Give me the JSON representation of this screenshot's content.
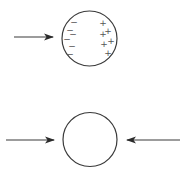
{
  "diagram": {
    "panels": [
      {
        "name": "polarized-sphere",
        "arrows": [
          {
            "direction": "right",
            "x1": 14,
            "y1": 37,
            "x2": 53,
            "y2": 37
          }
        ],
        "sphere": {
          "cx": 89.5,
          "cy": 38.5,
          "r": 27.5
        },
        "charges": {
          "negative": [
            {
              "symbol": "−",
              "x": 74,
              "y": 22
            },
            {
              "symbol": "−",
              "x": 70,
              "y": 30
            },
            {
              "symbol": "−",
              "x": 73,
              "y": 34
            },
            {
              "symbol": "−",
              "x": 67,
              "y": 39
            },
            {
              "symbol": "−",
              "x": 72,
              "y": 46
            },
            {
              "symbol": "−",
              "x": 70,
              "y": 54
            }
          ],
          "positive": [
            {
              "symbol": "+",
              "x": 103,
              "y": 23
            },
            {
              "symbol": "+",
              "x": 108,
              "y": 31
            },
            {
              "symbol": "+",
              "x": 103,
              "y": 34
            },
            {
              "symbol": "+",
              "x": 111,
              "y": 41
            },
            {
              "symbol": "+",
              "x": 104,
              "y": 44
            },
            {
              "symbol": "+",
              "x": 108,
              "y": 53
            }
          ]
        }
      },
      {
        "name": "neutral-sphere",
        "arrows": [
          {
            "direction": "right",
            "x1": 6,
            "y1": 140,
            "x2": 54,
            "y2": 140
          },
          {
            "direction": "left",
            "x1": 180,
            "y1": 140,
            "x2": 127,
            "y2": 140
          }
        ],
        "sphere": {
          "cx": 90,
          "cy": 139.5,
          "r": 27
        }
      }
    ],
    "colors": {
      "line": "#3a3a3a",
      "charge": "#555555",
      "background": "#ffffff"
    }
  }
}
